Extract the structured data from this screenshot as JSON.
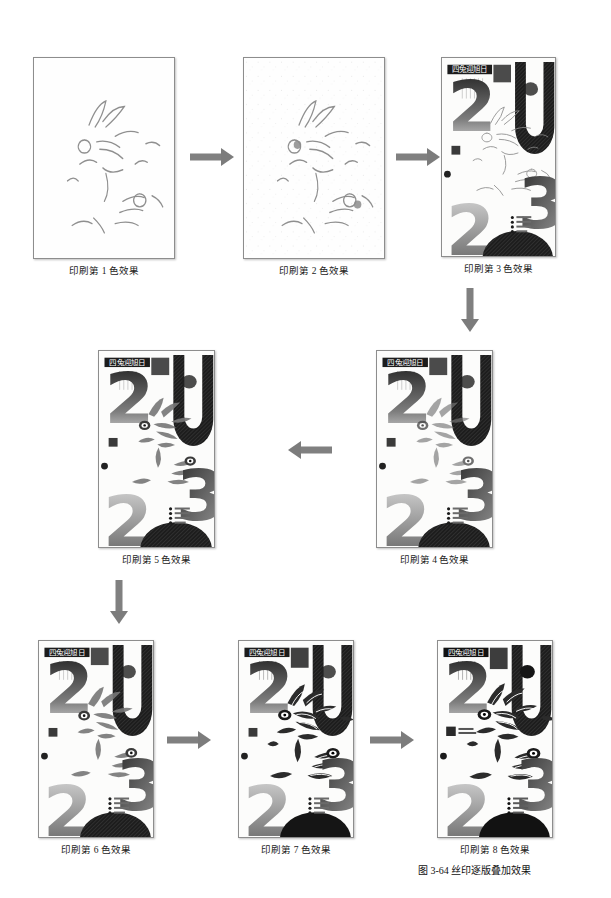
{
  "figure": {
    "number": "图 3-64",
    "title": "丝印逐版叠加效果",
    "caption_full": "图 3-64 丝印逐版叠加效果"
  },
  "poster": {
    "title_cn": "四兔迎旭日",
    "side_text_cn": "癸卯年·兔年大吉",
    "numerals": [
      "2",
      "0",
      "2",
      "3"
    ],
    "stamp_cn": "兔",
    "stamp_en_line1": "YEAR",
    "stamp_en_line2": "OF RABBIT",
    "legend_items": [
      "四兔迎春",
      "玉兔呈祥",
      "丁卯新岁",
      "吉祥如意"
    ]
  },
  "steps": [
    {
      "id": 1,
      "caption": "印刷第 1 色效果",
      "colors": 1
    },
    {
      "id": 2,
      "caption": "印刷第 2 色效果",
      "colors": 2
    },
    {
      "id": 3,
      "caption": "印刷第 3 色效果",
      "colors": 3
    },
    {
      "id": 4,
      "caption": "印刷第 4 色效果",
      "colors": 4
    },
    {
      "id": 5,
      "caption": "印刷第 5 色效果",
      "colors": 5
    },
    {
      "id": 6,
      "caption": "印刷第 6 色效果",
      "colors": 6
    },
    {
      "id": 7,
      "caption": "印刷第 7 色效果",
      "colors": 7
    },
    {
      "id": 8,
      "caption": "印刷第 8 色效果",
      "colors": 8
    }
  ],
  "flow": {
    "arrow_1_2": "arrow-right",
    "arrow_2_3": "arrow-right",
    "arrow_3_4": "arrow-down",
    "arrow_4_5": "arrow-left",
    "arrow_5_6": "arrow-down",
    "arrow_6_7": "arrow-right",
    "arrow_7_8": "arrow-right"
  },
  "colors": {
    "page_background": "#ffffff",
    "panel_border": "#8d8d8d",
    "arrow": "#7c7c7c",
    "ink_dark": "#1b1b1b",
    "ink_mid": "#6e6e6e",
    "ink_light": "#b9b9b9",
    "caption_text": "#1a1a1a"
  }
}
